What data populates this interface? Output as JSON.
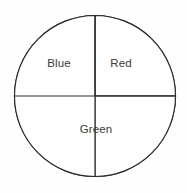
{
  "chart_data": {
    "type": "pie",
    "title": "",
    "subtitle": "",
    "xlabel": "",
    "ylabel": "",
    "grid": false,
    "legend": "none",
    "labels_position": "inside-slice",
    "categories": [
      "Blue",
      "Red",
      "Green"
    ],
    "values": [
      25,
      50,
      25
    ],
    "units": "percent",
    "slices": [
      {
        "label": "Blue",
        "value": 25,
        "percent": 25,
        "start_angle_deg": 270,
        "end_angle_deg": 360,
        "fill": "#ffffff",
        "stroke": "#2b2b2b",
        "position": "upper-left-quadrant"
      },
      {
        "label": "Red",
        "value": 25,
        "percent": 25,
        "start_angle_deg": 0,
        "end_angle_deg": 90,
        "fill": "#ffffff",
        "stroke": "#2b2b2b",
        "position": "upper-right-quadrant"
      },
      {
        "label": "Green",
        "value": 50,
        "percent": 50,
        "start_angle_deg": 90,
        "end_angle_deg": 270,
        "fill": "#ffffff",
        "stroke": "#2b2b2b",
        "position": "bottom-half"
      }
    ]
  },
  "figure": {
    "background": "#fefefe",
    "outline_color": "#2b2b2b",
    "label_color": "#3a3a3a",
    "center_x": 95,
    "center_y": 96,
    "radius": 81
  },
  "labels": {
    "blue": "Blue",
    "red": "Red",
    "green": "Green"
  }
}
